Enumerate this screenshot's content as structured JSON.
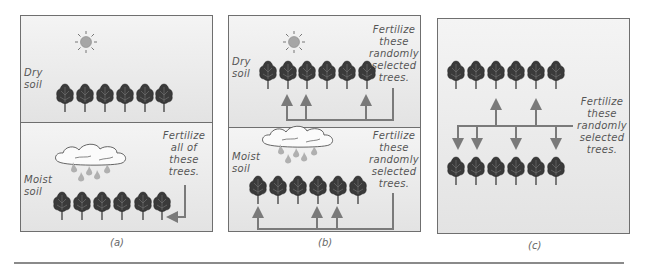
{
  "figure": {
    "panels": [
      {
        "id": "a",
        "caption": "(a)",
        "top_label": [
          "Dry",
          "soil"
        ],
        "bottom_label": [
          "Moist",
          "soil"
        ],
        "instruction": [
          "Fertilize",
          "all of",
          "these",
          "trees."
        ]
      },
      {
        "id": "b",
        "caption": "(b)",
        "top_label": [
          "Dry",
          "soil"
        ],
        "bottom_label": [
          "Moist",
          "soil"
        ],
        "top_instruction": [
          "Fertilize",
          "these",
          "randomly",
          "selected",
          "trees."
        ],
        "bottom_instruction": [
          "Fertilize",
          "these",
          "randomly",
          "selected",
          "trees."
        ]
      },
      {
        "id": "c",
        "caption": "(c)",
        "instruction": [
          "Fertilize",
          "these",
          "randomly",
          "selected",
          "trees."
        ]
      }
    ],
    "colors": {
      "border": "#6f6f6f",
      "arrow": "#7a7a7a",
      "background": "#ececec",
      "sun": "#a8a8a8",
      "tree": "#2f2f2f"
    },
    "icons": [
      "sun-icon",
      "cloud-rain-icon",
      "tree-icon",
      "arrow-icon"
    ]
  }
}
